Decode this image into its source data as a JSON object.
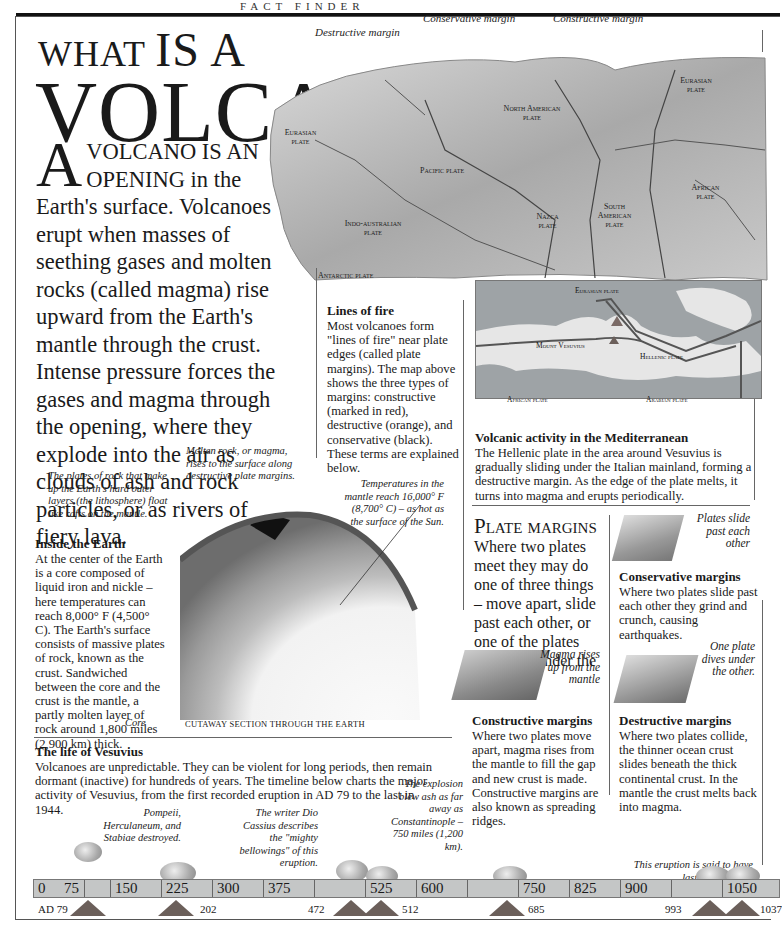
{
  "header": {
    "strip_text": "FACT FINDER"
  },
  "title": {
    "line1_small": "WHAT",
    "line1_big": "IS A",
    "line2": "VOLCANO?"
  },
  "intro": {
    "drop_cap": "A",
    "caps_lead": "VOLCANO IS AN OPENING",
    "text": " in the Earth's surface. Volcanoes erupt when masses of seething gases and molten rocks (called magma) rise upward from the Earth's mantle through the crust. Intense pressure forces the gases and magma through the opening, where they explode into the air as clouds of ash and rock particles, or as rivers of fiery lava."
  },
  "world_map": {
    "callouts": {
      "destructive": "Destructive margin",
      "conservative": "Conservative margin",
      "constructive": "Constructive margin"
    },
    "plates": [
      {
        "name": "Eurasian plate",
        "x": 688,
        "y": 78
      },
      {
        "name": "North American plate",
        "x": 520,
        "y": 106
      },
      {
        "name": "Eurasian plate",
        "x": 300,
        "y": 130
      },
      {
        "name": "Pacific plate",
        "x": 435,
        "y": 168
      },
      {
        "name": "Nazca plate",
        "x": 545,
        "y": 214
      },
      {
        "name": "South American plate",
        "x": 612,
        "y": 208
      },
      {
        "name": "African plate",
        "x": 702,
        "y": 185
      },
      {
        "name": "Indo-australian plate",
        "x": 350,
        "y": 221
      },
      {
        "name": "Antarctic plate",
        "x": 318,
        "y": 273
      }
    ]
  },
  "lines_of_fire": {
    "heading": "Lines of fire",
    "body": "Most volcanoes form \"lines of fire\" near plate edges (called plate margins). The map above shows the three types of margins: constructive (marked in red), destructive (orange), and conservative (black). These terms are explained below."
  },
  "mediterranean_map": {
    "labels": {
      "eurasian": "Eurasian plate",
      "vesuvius": "Mount Vesuvius",
      "hellenic": "Hellenic plate",
      "african": "African plate",
      "arabian": "Arabian plate"
    },
    "heading": "Volcanic activity in the Mediterranean",
    "body": "The Hellenic plate in the area around Vesuvius is gradually sliding under the Italian mainland, forming a destructive margin. As the edge of the plate melts, it turns into magma and erupts periodically."
  },
  "earth_cutaway": {
    "caption_plates": "The plates of rock that make up the Earth's hard outer layers (the lithosphere) float like rafts on the mantle.",
    "caption_magma": "Molten rock, or magma, rises to the surface along destructive plate margins.",
    "caption_temp": "Temperatures in the mantle reach 16,000° F (8,700° C) – as hot as the surface of the Sun.",
    "caption_core": "Core",
    "section_label": "CUTAWAY SECTION THROUGH THE EARTH",
    "heading": "Inside the Earth",
    "body": "At the center of the Earth is a core composed of liquid iron and nickle – here temperatures can reach 8,000° F (4,500° C). The Earth's surface consists of massive plates of rock, known as the crust. Sandwiched between the core and the crust is the mantle, a partly molten layer of rock around 1,800 miles (2,900 km) thick."
  },
  "plate_margins": {
    "title": "Plate margins",
    "body": "Where two plates meet they may do one of three things – move apart, slide past each other, or one of the plates may sink under the other.",
    "conservative": {
      "caption": "Plates slide past each other",
      "heading": "Conservative margins",
      "body": "Where two plates slide past each other they grind and crunch, causing earthquakes."
    },
    "constructive": {
      "caption": "Magma rises up from the mantle",
      "heading": "Constructive margins",
      "body": "Where two plates move apart, magma rises from the mantle to fill the gap and new crust is made. Constructive margins are also known as spreading ridges."
    },
    "destructive": {
      "caption": "One plate dives under the other.",
      "heading": "Destructive margins",
      "body": "Where two plates collide, the thinner ocean crust slides beneath the thick continental crust. In the mantle the crust melts back into magma."
    }
  },
  "vesuvius": {
    "heading": "The life of Vesuvius",
    "body": "Volcanoes are unpredictable. They can be violent for long periods, then remain dormant (inactive) for hundreds of years. The timeline below charts the major activity of Vesuvius, from the first recorded eruption in AD 79 to the last in 1944.",
    "notes": {
      "ad79": "Pompeii, Herculaneum, and Stabiae destroyed.",
      "y202": "The writer Dio Cassius describes the \"mighty bellowings\" of this eruption.",
      "y472": "The explosion blew ash as far away as Constantinople – 750 miles (1,200 km).",
      "y1037": "This eruption is said to have lasted two years."
    },
    "timeline_ticks": [
      "0",
      "75",
      "150",
      "225",
      "300",
      "375",
      "",
      "525",
      "600",
      "",
      "750",
      "825",
      "900",
      "",
      "1050"
    ],
    "eruptions": [
      {
        "label": "AD 79",
        "x": 60
      },
      {
        "label": "202",
        "x": 195
      },
      {
        "label": "472",
        "x": 355
      },
      {
        "label": "512",
        "x": 378
      },
      {
        "label": "685",
        "x": 502
      },
      {
        "label": "993",
        "x": 712
      },
      {
        "label": "1037",
        "x": 752
      }
    ]
  }
}
